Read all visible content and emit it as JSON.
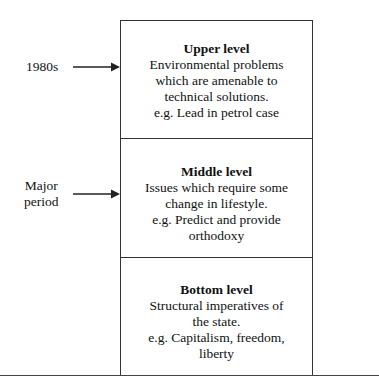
{
  "diagram": {
    "levels": [
      {
        "title": "Upper level",
        "lines": [
          "Environmental problems",
          "which are amenable to",
          "technical solutions.",
          "e.g. Lead in petrol case"
        ]
      },
      {
        "title": "Middle level",
        "lines": [
          "Issues which require some",
          "change in lifestyle.",
          "e.g. Predict and provide",
          "orthodoxy"
        ]
      },
      {
        "title": "Bottom level",
        "lines": [
          "Structural imperatives of",
          "the state.",
          "e.g. Capitalism, freedom,",
          "liberty"
        ]
      }
    ],
    "annotations": [
      {
        "label_lines": [
          "1980s"
        ],
        "points_to": "Upper level"
      },
      {
        "label_lines": [
          "Major",
          "period"
        ],
        "points_to": "Middle level"
      }
    ],
    "colors": {
      "line": "#333333",
      "text": "#111111",
      "background": "#ffffff"
    }
  }
}
